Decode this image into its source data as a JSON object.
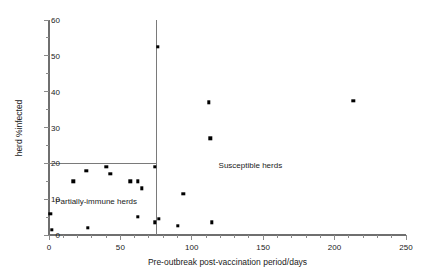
{
  "chart_data": {
    "type": "scatter",
    "title": "",
    "xlabel": "Pre-outbreak post-vaccination period/days",
    "ylabel": "herd %infected",
    "xlim": [
      0,
      250
    ],
    "ylim": [
      0,
      60
    ],
    "xticks": [
      0,
      50,
      100,
      150,
      200,
      250
    ],
    "yticks": [
      0,
      10,
      20,
      30,
      40,
      50,
      60
    ],
    "xminor_step": 10,
    "yminor_step": 5,
    "grid": false,
    "legend": "none",
    "annotations": [
      {
        "text": "Partially-immune herds",
        "x": 33,
        "y": 9.5
      },
      {
        "text": "Susceptible herds",
        "x": 141,
        "y": 19.5
      }
    ],
    "reference_lines": [
      {
        "orientation": "vertical",
        "x": 75,
        "from_y": 0,
        "to_y": 60
      },
      {
        "orientation": "horizontal",
        "y": 20,
        "from_x": 0,
        "to_x": 75
      }
    ],
    "points": [
      {
        "x": 1,
        "y": 6
      },
      {
        "x": 2,
        "y": 1.5
      },
      {
        "x": 17,
        "y": 15
      },
      {
        "x": 26,
        "y": 18
      },
      {
        "x": 27,
        "y": 2
      },
      {
        "x": 40,
        "y": 19
      },
      {
        "x": 43,
        "y": 17
      },
      {
        "x": 57,
        "y": 15
      },
      {
        "x": 62,
        "y": 15
      },
      {
        "x": 62,
        "y": 5
      },
      {
        "x": 65,
        "y": 13
      },
      {
        "x": 74,
        "y": 19
      },
      {
        "x": 74,
        "y": 3.5
      },
      {
        "x": 76,
        "y": 52.5
      },
      {
        "x": 77,
        "y": 4.5
      },
      {
        "x": 90,
        "y": 2.5
      },
      {
        "x": 94,
        "y": 11.5
      },
      {
        "x": 112,
        "y": 37
      },
      {
        "x": 113,
        "y": 27
      },
      {
        "x": 114,
        "y": 3.5
      },
      {
        "x": 213,
        "y": 37.5
      }
    ]
  }
}
